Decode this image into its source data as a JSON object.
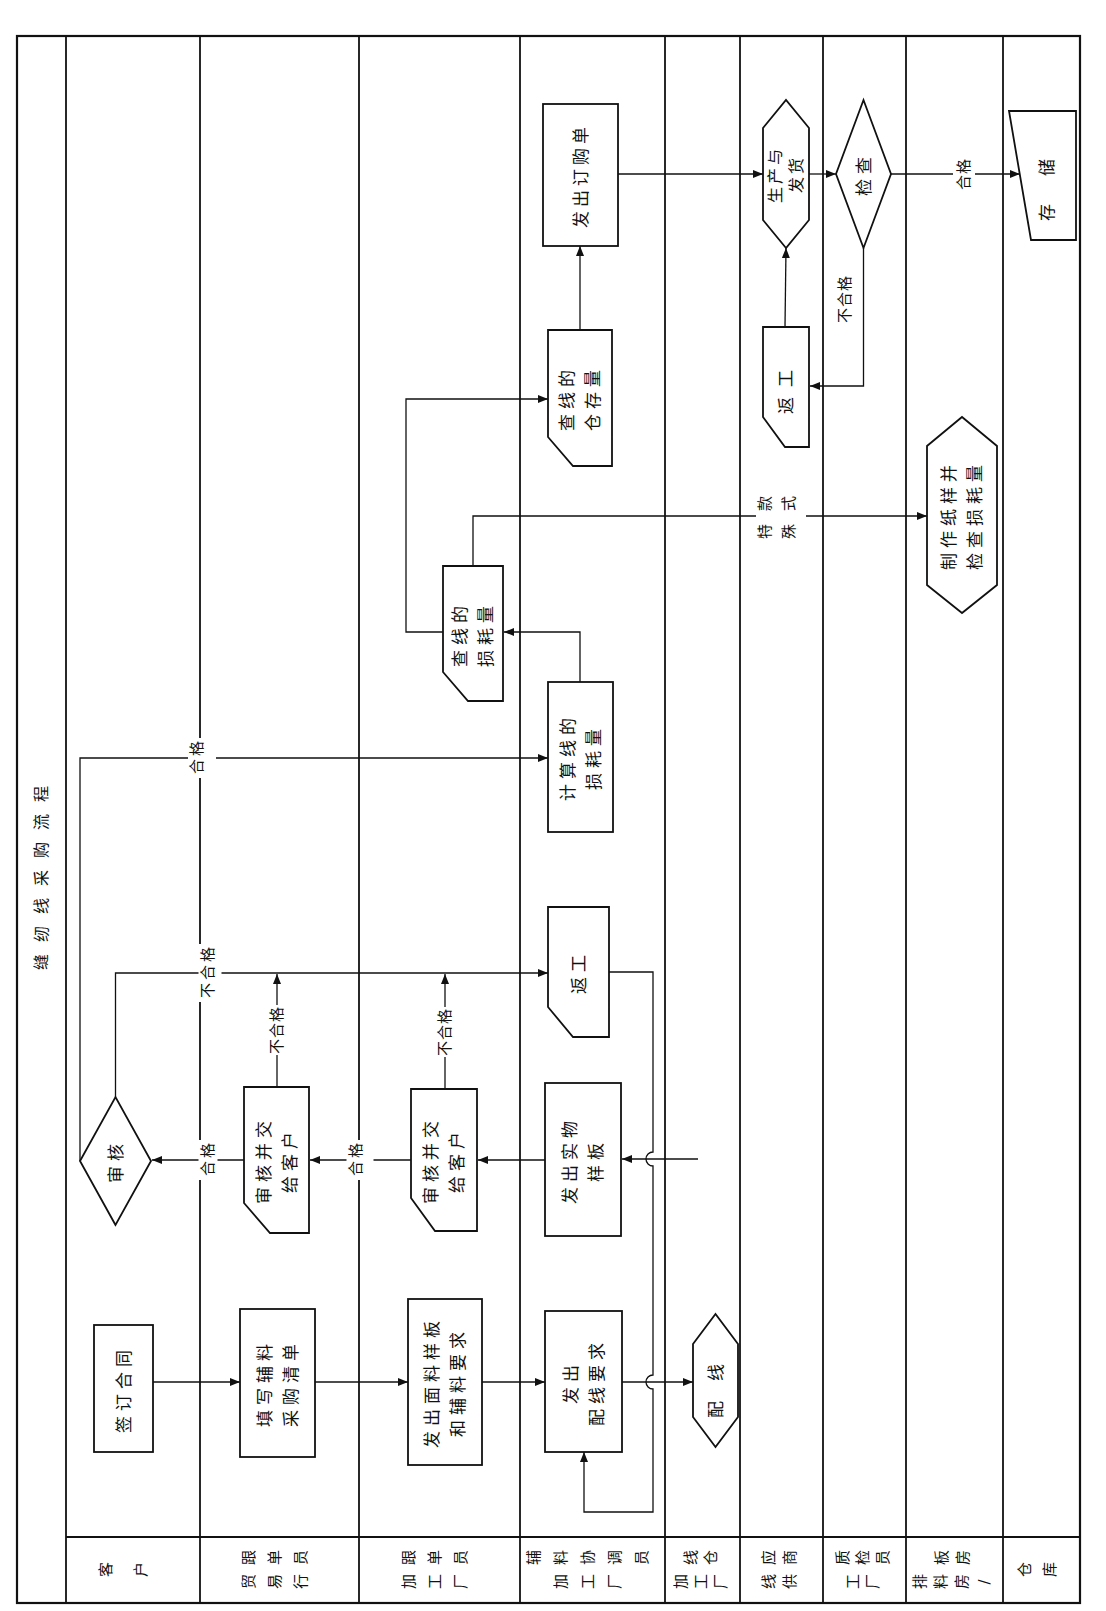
{
  "title": "缝纫线采购流程",
  "lanes": [
    {
      "id": "customer",
      "label": "客户",
      "label_lines": [
        "客户"
      ]
    },
    {
      "id": "trade-merchandiser",
      "label": "贸易行跟单员",
      "label_lines": [
        "贸易行",
        "跟单员"
      ]
    },
    {
      "id": "factory-merchandiser",
      "label": "加工厂跟单员",
      "label_lines": [
        "加工厂",
        "跟单员"
      ]
    },
    {
      "id": "factory-accessory-coordinator",
      "label": "加工厂辅料协调员",
      "label_lines": [
        "加工厂",
        "辅料协调员"
      ]
    },
    {
      "id": "factory-thread-warehouse",
      "label": "加工厂线仓",
      "label_lines": [
        "加工厂",
        "线仓"
      ]
    },
    {
      "id": "thread-supplier",
      "label": "线供应商",
      "label_lines": [
        "线供",
        "应商"
      ]
    },
    {
      "id": "factory-qc",
      "label": "工厂质检员",
      "label_lines": [
        "工厂",
        "质检员"
      ]
    },
    {
      "id": "marker-pattern-room",
      "label": "排料房/板房",
      "label_lines": [
        "排料房/",
        "板房"
      ]
    },
    {
      "id": "warehouse",
      "label": "仓库",
      "label_lines": [
        "仓库"
      ]
    }
  ],
  "nodes": [
    {
      "id": "sign-contract",
      "lane": "客户",
      "shape": "process",
      "lines": [
        "签订合同"
      ]
    },
    {
      "id": "review-decision",
      "lane": "客户",
      "shape": "decision",
      "lines": [
        "审核"
      ]
    },
    {
      "id": "fill-purchase-list",
      "lane": "贸易行跟单员",
      "shape": "process",
      "lines": [
        "填写辅料",
        "采购清单"
      ]
    },
    {
      "id": "trade-review-submit",
      "lane": "贸易行跟单员",
      "shape": "card",
      "lines": [
        "审核并交",
        "给客户"
      ]
    },
    {
      "id": "issue-fabric-sample",
      "lane": "加工厂跟单员",
      "shape": "process",
      "lines": [
        "发出面料样板",
        "和辅料要求"
      ]
    },
    {
      "id": "factory-review-submit",
      "lane": "加工厂跟单员",
      "shape": "card",
      "lines": [
        "审核并交",
        "给客户"
      ]
    },
    {
      "id": "check-thread-loss",
      "lane": "加工厂跟单员",
      "shape": "card",
      "lines": [
        "查线的",
        "损耗量"
      ]
    },
    {
      "id": "issue-thread-request",
      "lane": "加工厂辅料协调员",
      "shape": "process",
      "lines": [
        "发出",
        "配线要求"
      ]
    },
    {
      "id": "issue-physical-sample",
      "lane": "加工厂辅料协调员",
      "shape": "process",
      "lines": [
        "发出实物",
        "样板"
      ]
    },
    {
      "id": "rework-coordinator",
      "lane": "加工厂辅料协调员",
      "shape": "card",
      "lines": [
        "返工"
      ]
    },
    {
      "id": "calc-thread-loss",
      "lane": "加工厂辅料协调员",
      "shape": "process",
      "lines": [
        "计算线的",
        "损耗量"
      ]
    },
    {
      "id": "check-thread-stock",
      "lane": "加工厂辅料协调员",
      "shape": "card",
      "lines": [
        "查线的",
        "仓存量"
      ]
    },
    {
      "id": "issue-purchase-order",
      "lane": "加工厂辅料协调员",
      "shape": "process",
      "lines": [
        "发出订购单"
      ]
    },
    {
      "id": "thread-matching",
      "lane": "加工厂线仓",
      "shape": "preparation",
      "lines": [
        "配线"
      ]
    },
    {
      "id": "produce-ship",
      "lane": "线供应商",
      "shape": "preparation",
      "lines": [
        "生产与",
        "发货"
      ]
    },
    {
      "id": "rework-supplier",
      "lane": "线供应商",
      "shape": "card",
      "lines": [
        "返工"
      ]
    },
    {
      "id": "inspect",
      "lane": "工厂质检员",
      "shape": "decision",
      "lines": [
        "检查"
      ]
    },
    {
      "id": "make-paper-pattern",
      "lane": "排料房/板房",
      "shape": "preparation",
      "lines": [
        "制作纸样并",
        "检查损耗量"
      ]
    },
    {
      "id": "store",
      "lane": "仓库",
      "shape": "manual-input",
      "lines": [
        "存储"
      ]
    }
  ],
  "edge_labels": [
    {
      "text": "合格",
      "chars": [
        "合",
        "格"
      ],
      "from": "trade-review-submit",
      "to": "review-decision"
    },
    {
      "text": "合格",
      "chars": [
        "合",
        "格"
      ],
      "from": "factory-review-submit",
      "to": "trade-review-submit"
    },
    {
      "text": "合格",
      "chars": [
        "合",
        "格"
      ],
      "from": "review-decision",
      "to": "calc-thread-loss"
    },
    {
      "text": "不合格",
      "chars": [
        "不",
        "合",
        "格"
      ],
      "from": "review-decision",
      "to": "rework-coordinator"
    },
    {
      "text": "不合格",
      "from": "trade-review-submit",
      "to": "rework-coordinator"
    },
    {
      "text": "不合格",
      "from": "factory-review-submit",
      "to": "rework-coordinator"
    },
    {
      "text": "特殊款式",
      "lines": [
        "特殊",
        "款式"
      ],
      "from": "check-thread-loss",
      "to": "make-paper-pattern"
    },
    {
      "text": "合格",
      "from": "inspect",
      "to": "store"
    },
    {
      "text": "不合格",
      "from": "inspect",
      "to": "rework-supplier"
    }
  ]
}
